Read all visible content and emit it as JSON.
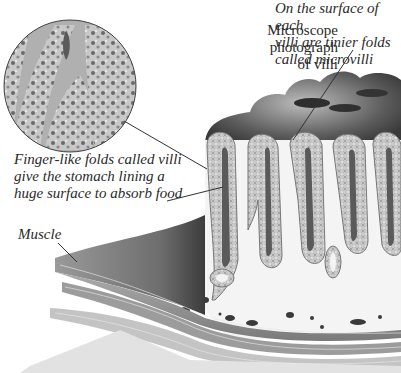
{
  "figure": {
    "top_caption_fragment": "...p ... g...",
    "labels": {
      "microscope": [
        "Microscope",
        "photograph",
        "of villi"
      ],
      "microvilli": [
        "On the surface of each",
        "villi are tinier folds",
        "called microvilli"
      ],
      "villi": [
        "Finger-like folds called villi",
        "give the stomach lining a",
        "huge surface to absorb food"
      ],
      "muscle": "Muscle"
    },
    "colors": {
      "background": "#ffffff",
      "text": "#2a2a2a",
      "leader_line": "#333333",
      "tissue_dark": "#4a4a4a",
      "tissue_mid": "#8a8a8a",
      "tissue_light": "#d8d8d8"
    }
  }
}
